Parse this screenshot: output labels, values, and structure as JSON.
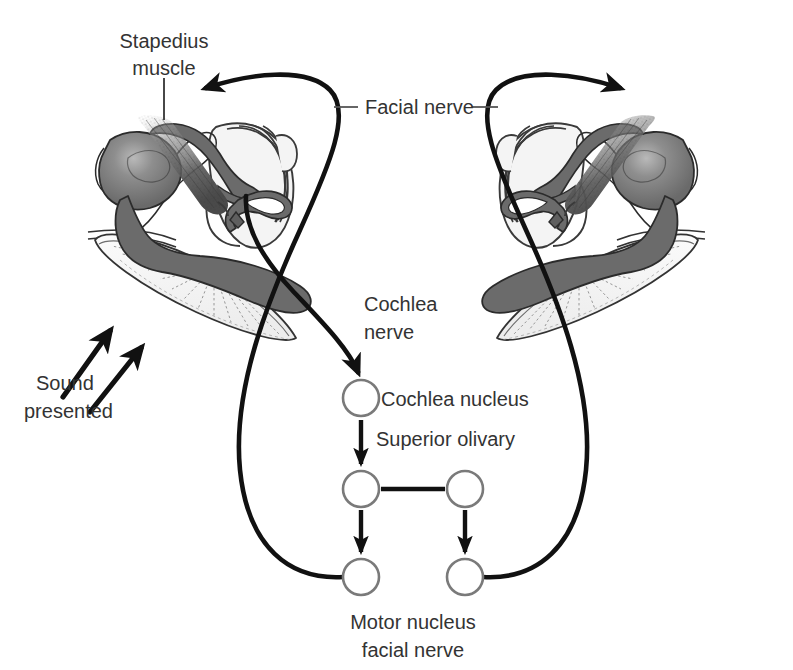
{
  "figure": {
    "background_color": "#ffffff",
    "text_color": "#333333",
    "nerve_color": "#111111",
    "ossicle_color": "#6b6b6b",
    "ossicle_outline": "#2b2b2b",
    "cochlea_fill": "#f2f2f2",
    "cochlea_outline": "#3a3a3a",
    "eardrum_fill": "#f4f4f4",
    "eardrum_outline": "#333333",
    "nucleus_outline": "#7a7a7a",
    "muscle_color": "#555555"
  },
  "labels": {
    "stapedius_muscle_line1": "Stapedius",
    "stapedius_muscle_line2": "muscle",
    "facial_nerve": "Facial nerve",
    "cochlea_nerve_line1": "Cochlea",
    "cochlea_nerve_line2": "nerve",
    "sound_presented_line1": "Sound",
    "sound_presented_line2": "presented",
    "cochlea_nucleus": "Cochlea nucleus",
    "superior_olivary": "Superior olivary",
    "motor_nucleus_line1": "Motor nucleus",
    "motor_nucleus_line2": "facial nerve"
  },
  "nodes": [
    {
      "id": "cochlea-nucleus",
      "label": "Cochlea nucleus",
      "cx": 361,
      "cy": 398,
      "r": 18
    },
    {
      "id": "superior-olivary-left",
      "label": "Superior olivary",
      "cx": 361,
      "cy": 489,
      "r": 18
    },
    {
      "id": "superior-olivary-right",
      "label": "Superior olivary",
      "cx": 465,
      "cy": 489,
      "r": 18
    },
    {
      "id": "motor-nucleus-left",
      "label": "Motor nucleus facial nerve",
      "cx": 361,
      "cy": 577,
      "r": 18
    },
    {
      "id": "motor-nucleus-right",
      "label": "Motor nucleus facial nerve",
      "cx": 465,
      "cy": 577,
      "r": 18
    }
  ],
  "pathway_steps": [
    "Sound presented to left ear",
    "Tympanic membrane and ossicles transmit vibration",
    "Cochlea nerve carries signal to cochlea nucleus",
    "Cochlea nucleus projects to superior olivary complex",
    "Superior olivary nuclei project bilaterally to motor nucleus of facial nerve",
    "Facial nerve activates stapedius muscle in both ears"
  ],
  "sides": {
    "left": "left ear",
    "right": "right ear"
  },
  "icons": {
    "sound_arrow": "sound-arrow-icon",
    "facial_nerve_arrow": "facial-nerve-arrowhead-icon",
    "cochlea_nerve_arrow": "cochlea-nerve-arrowhead-icon"
  }
}
